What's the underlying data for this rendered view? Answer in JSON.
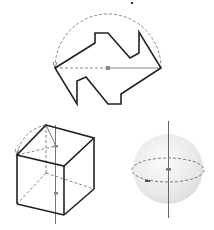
{
  "figure": {
    "colors": {
      "outline": "#222222",
      "dashed": "#888888",
      "axis": "#777777",
      "center_dot": "#888888",
      "sphere_fill": "#e8e8e8",
      "background": "#ffffff"
    },
    "panels": [
      {
        "id": "polygon-rotation",
        "shape": "arrow-like polygon rotated about horizontal axis",
        "rotation_arc": "dashed semicircle"
      },
      {
        "id": "cube-rotation",
        "shape": "cube rotated about vertical axis",
        "rotation_arc": "dashed arc"
      },
      {
        "id": "sphere",
        "shape": "sphere with vertical axis and dashed equator"
      }
    ]
  }
}
